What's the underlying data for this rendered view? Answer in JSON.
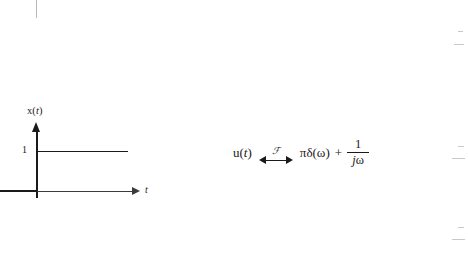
{
  "figure": {
    "y_axis_label": "x(t)",
    "y_axis_label_fn": "x",
    "y_axis_label_var": "t",
    "x_axis_label": "t",
    "amplitude_label": "1"
  },
  "equation": {
    "lhs_fn": "u",
    "lhs_open": "(",
    "lhs_var": "t",
    "lhs_close": ")",
    "transform_symbol": "ℱ",
    "rhs_first_term": "πδ(ω)",
    "operator": "+",
    "fraction_numerator": "1",
    "fraction_denominator_j": "j",
    "fraction_denominator_omega": "ω"
  },
  "chart_data": {
    "type": "line",
    "title": "",
    "xlabel": "t",
    "ylabel": "x(t)",
    "x": [
      -1.0,
      0.0,
      0.0,
      2.6
    ],
    "y": [
      0,
      0,
      1,
      1
    ],
    "xlim": [
      -1.0,
      2.9
    ],
    "ylim": [
      0,
      1.35
    ],
    "yticks": [
      1
    ],
    "ytick_labels": [
      "1"
    ],
    "xticks": [],
    "xtick_labels": [],
    "grid": false,
    "legend": false
  }
}
